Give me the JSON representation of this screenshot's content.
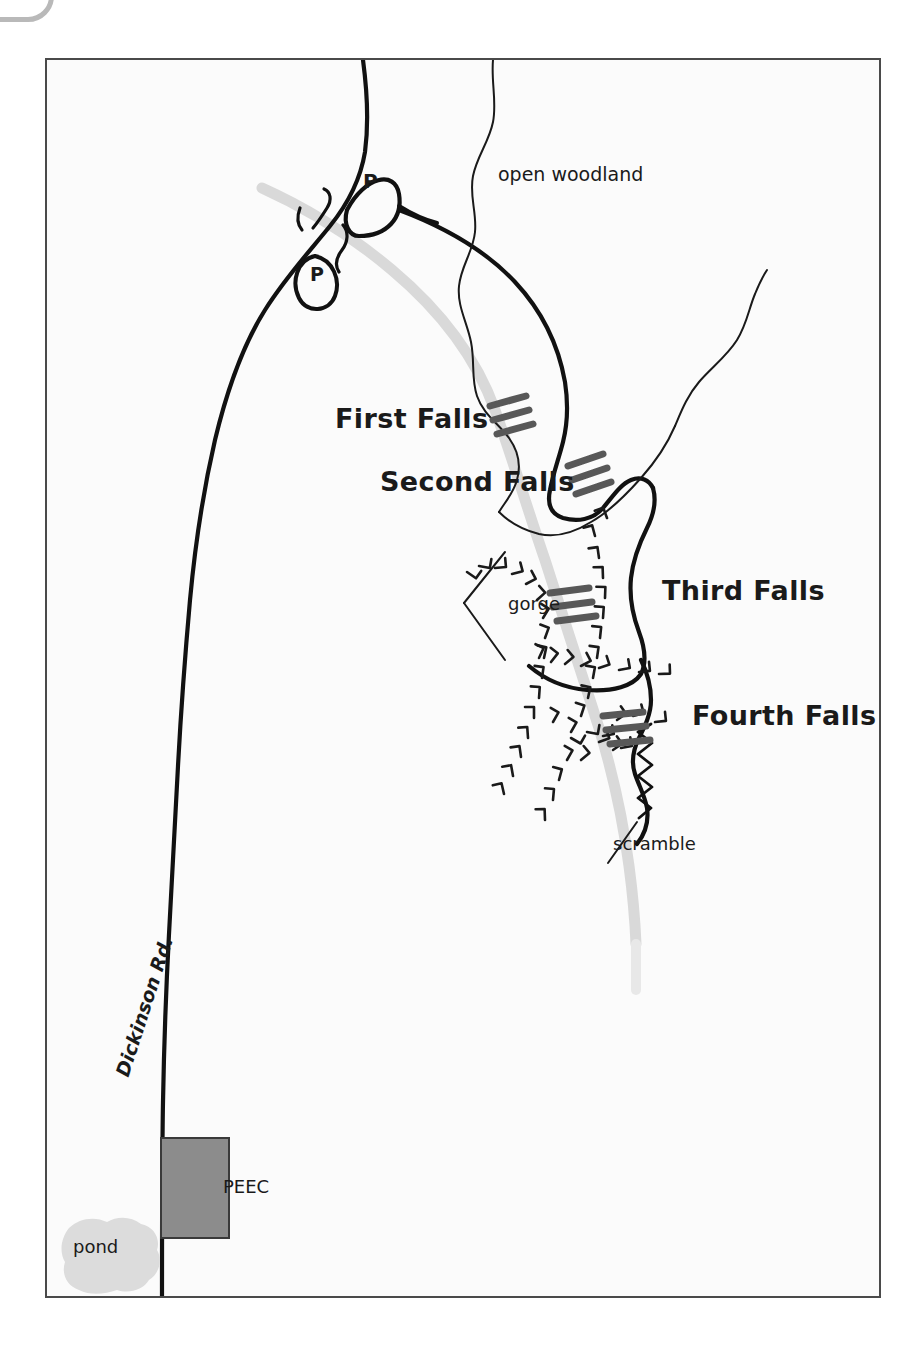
{
  "document": {
    "kind": "trail-map",
    "frame": {
      "border_color": "#4a4a4a",
      "background": "#fbfbfb"
    }
  },
  "logo": {
    "name": "partial-logo-mark",
    "color": "#b9b9b9"
  },
  "colors": {
    "road": "#111111",
    "trail": "#111111",
    "stream": "#d9d9d9",
    "waterfall_symbol": "#585858",
    "building": "#8c8c8c",
    "building_outline": "#3a3a3a",
    "pond": "#dcdcdc",
    "text": "#1a1a1a",
    "frame": "#4a4a4a"
  },
  "labels": {
    "open_woodland": "open woodland",
    "first_falls": "First Falls",
    "second_falls": "Second Falls",
    "third_falls": "Third Falls",
    "fourth_falls": "Fourth Falls",
    "gorge": "gorge",
    "scramble": "scramble",
    "dickinson_road": "Dickinson Rd.",
    "peec": "PEEC",
    "pond": "pond"
  },
  "markers": [
    {
      "name": "parking-marker-north",
      "label": "P"
    },
    {
      "name": "parking-marker-south",
      "label": "P"
    }
  ],
  "features": [
    {
      "name": "dickinson-road",
      "type": "road",
      "label": "Dickinson Rd."
    },
    {
      "name": "stream",
      "type": "watercourse"
    },
    {
      "name": "woodland-trail",
      "type": "trail",
      "label": "open woodland"
    },
    {
      "name": "gorge-rim",
      "type": "cliff-hachures",
      "label": "gorge"
    },
    {
      "name": "scramble-section",
      "type": "trail-scramble",
      "label": "scramble"
    },
    {
      "name": "peec-building",
      "type": "building",
      "label": "PEEC"
    },
    {
      "name": "pond",
      "type": "waterbody",
      "label": "pond"
    },
    {
      "name": "first-falls-symbol",
      "type": "waterfall"
    },
    {
      "name": "second-falls-symbol",
      "type": "waterfall"
    },
    {
      "name": "third-falls-symbol",
      "type": "waterfall"
    },
    {
      "name": "fourth-falls-symbol",
      "type": "waterfall"
    }
  ]
}
